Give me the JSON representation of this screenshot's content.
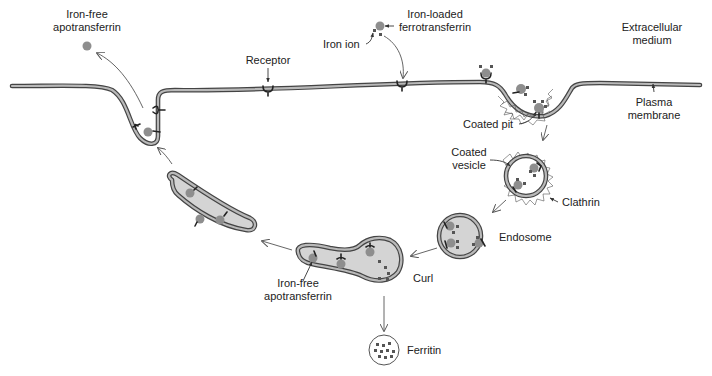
{
  "colors": {
    "membrane": "#444444",
    "membrane_core": "#b9b9b9",
    "vesicle_fill": "#d4d4d4",
    "transferrin": "#8e8e8e",
    "iron": "#555555",
    "text": "#222222"
  },
  "labels": {
    "iron_free_top_line1": "Iron-free",
    "iron_free_top_line2": "apotransferrin",
    "iron_loaded_line1": "Iron-loaded",
    "iron_loaded_line2": "ferrotransferrin",
    "iron_ion": "Iron ion",
    "receptor": "Receptor",
    "extracellular_line1": "Extracellular",
    "extracellular_line2": "medium",
    "plasma_line1": "Plasma",
    "plasma_line2": "membrane",
    "coated_pit": "Coated pit",
    "coated_vesicle_line1": "Coated",
    "coated_vesicle_line2": "vesicle",
    "clathrin": "Clathrin",
    "endosome": "Endosome",
    "curl": "Curl",
    "iron_free_bottom_line1": "Iron-free",
    "iron_free_bottom_line2": "apotransferrin",
    "ferritin": "Ferritin"
  },
  "steps": [
    "Iron-loaded ferrotransferrin binds receptor",
    "Coated pit",
    "Coated vesicle",
    "Endosome",
    "Curl",
    "Recycling vesicle",
    "Exocytosis releases iron-free apotransferrin"
  ]
}
